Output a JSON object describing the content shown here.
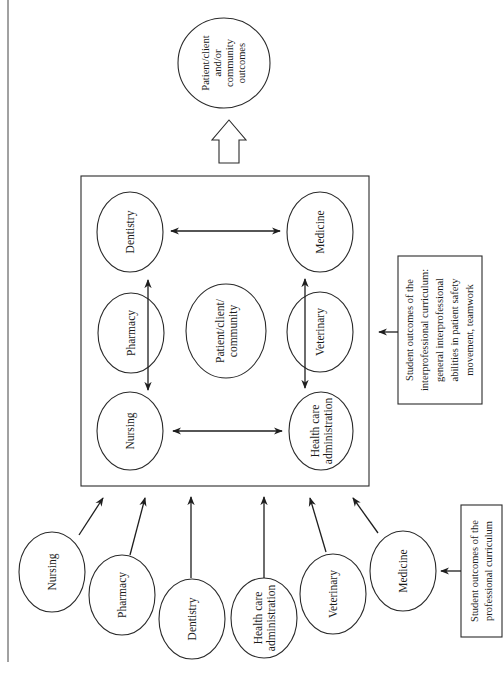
{
  "diagram": {
    "outcome_node": {
      "lines": [
        "Patient/client",
        "and/or",
        "community",
        "outcomes"
      ]
    },
    "interprofessional_box": {
      "center_node": {
        "lines": [
          "Patient/client/",
          "community"
        ]
      },
      "corner_nodes": {
        "dentistry": {
          "lines": [
            "Dentistry"
          ]
        },
        "medicine": {
          "lines": [
            "Medicine"
          ]
        },
        "pharmacy": {
          "lines": [
            "Pharmacy"
          ]
        },
        "veterinary": {
          "lines": [
            "Veterinary"
          ]
        },
        "nursing": {
          "lines": [
            "Nursing"
          ]
        },
        "health_care_administration": {
          "lines": [
            "Health care",
            "administration"
          ]
        }
      }
    },
    "interprofessional_label": {
      "lines": [
        "Student outcomes of the",
        "interprofessional curriculum:",
        "general interprofessional",
        "abilities in patient safety",
        "movement, teamwork"
      ]
    },
    "professional_nodes": [
      {
        "lines": [
          "Nursing"
        ]
      },
      {
        "lines": [
          "Pharmacy"
        ]
      },
      {
        "lines": [
          "Dentistry"
        ]
      },
      {
        "lines": [
          "Health care",
          "administration"
        ]
      },
      {
        "lines": [
          "Veterinary"
        ]
      },
      {
        "lines": [
          "Medicine"
        ]
      }
    ],
    "professional_label": {
      "lines": [
        "Student outcomes of the",
        "professional curriculum"
      ]
    }
  }
}
